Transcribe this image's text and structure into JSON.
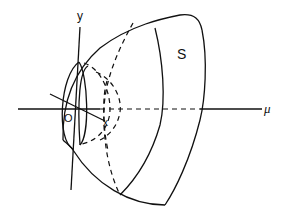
{
  "diagram": {
    "type": "3d-surface-sketch",
    "labels": {
      "y_axis": "y",
      "origin": "O",
      "x_axis": "x",
      "mu_axis": "μ",
      "surface": "S"
    },
    "elements": [
      "y-axis (vertical line through origin)",
      "x-axis (oblique line through origin)",
      "mu-axis (horizontal line, solid near origin and far right, dashed inside surface)",
      "outer surface S (bulging shell opening toward +mu)",
      "inner small lens-shaped ellipse near origin",
      "dashed hidden cross-section curves"
    ]
  }
}
